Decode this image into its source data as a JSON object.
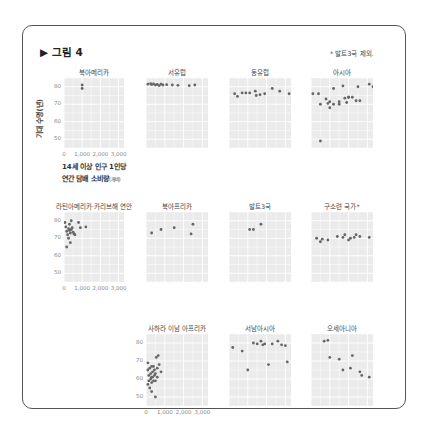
{
  "figure": {
    "title": "▶ 그림 4",
    "note": "* 발트3국 제외.",
    "y_axis_label": "기대 수명(년)",
    "x_axis_label_line1": "14세 이상 인구 1인당",
    "x_axis_label_line2": "연간 담배 소비량",
    "x_axis_label_unit": "(개비)",
    "colors": {
      "frame": "#555555",
      "panel_bg": "#ebebeb",
      "grid": "#ffffff",
      "point": "#666666"
    }
  },
  "chart_data": {
    "type": "scatter",
    "title": "그림 4",
    "xlabel": "14세 이상 인구 1인당 연간 담배 소비량(개비)",
    "ylabel": "기대 수명(년)",
    "xlim": [
      0,
      3300
    ],
    "ylim": [
      45,
      85
    ],
    "x_ticks": [
      "0",
      "1,000",
      "2,000",
      "3,000"
    ],
    "y_ticks": [
      "50",
      "60",
      "70",
      "80"
    ],
    "grid": true,
    "facet_layout": "3 rows, small multiples, shared axes",
    "note": "* 발트3국 제외.",
    "data_quality": "Traced approximations, not measured data. Point coordinates were read by eye from low-resolution zooms of ~60px panels (about 50 cigarettes per pixel on x, about 0.5 years per pixel on y). The figure has no data labels or country names; markers were not counted exactly. Treat values as rough shape only, not citable numbers.",
    "panels": [
      {
        "name": "북아메리카",
        "points": [
          [
            1000,
            81
          ],
          [
            1000,
            79
          ]
        ]
      },
      {
        "name": "서유럽",
        "points": [
          [
            100,
            81.5
          ],
          [
            250,
            81.8
          ],
          [
            300,
            81.2
          ],
          [
            400,
            81.6
          ],
          [
            500,
            81
          ],
          [
            600,
            81.3
          ],
          [
            700,
            80.7
          ],
          [
            800,
            81.5
          ],
          [
            900,
            81
          ],
          [
            1100,
            81.2
          ],
          [
            1400,
            81
          ],
          [
            1700,
            80.8
          ],
          [
            2300,
            80.6
          ],
          [
            2600,
            81
          ]
        ]
      },
      {
        "name": "동유럽",
        "points": [
          [
            300,
            76
          ],
          [
            450,
            74.5
          ],
          [
            700,
            76.5
          ],
          [
            900,
            76.5
          ],
          [
            1100,
            76.5
          ],
          [
            1400,
            77.5
          ],
          [
            1450,
            75
          ],
          [
            1650,
            75.5
          ],
          [
            1900,
            76
          ],
          [
            2300,
            79
          ],
          [
            2700,
            77.5
          ],
          [
            3200,
            76
          ]
        ]
      },
      {
        "name": "아시아",
        "points": [
          [
            100,
            76
          ],
          [
            400,
            76
          ],
          [
            500,
            70
          ],
          [
            800,
            73
          ],
          [
            900,
            70.5
          ],
          [
            1000,
            68
          ],
          [
            1000,
            71.5
          ],
          [
            1200,
            79
          ],
          [
            1200,
            70
          ],
          [
            1500,
            70
          ],
          [
            1500,
            71.5
          ],
          [
            1700,
            80.5
          ],
          [
            1800,
            73.5
          ],
          [
            1900,
            71
          ],
          [
            2000,
            74
          ],
          [
            2000,
            74
          ],
          [
            2200,
            74
          ],
          [
            2400,
            72
          ],
          [
            2600,
            72
          ],
          [
            3100,
            81.5
          ],
          [
            3300,
            80
          ],
          [
            3400,
            75
          ],
          [
            3400,
            72
          ],
          [
            500,
            49
          ],
          [
            2500,
            80
          ]
        ]
      },
      {
        "name": "라틴아메리카·카리브해 연안",
        "points": [
          [
            50,
            79
          ],
          [
            100,
            76.5
          ],
          [
            150,
            74
          ],
          [
            200,
            72
          ],
          [
            250,
            75.5
          ],
          [
            300,
            78
          ],
          [
            300,
            74.5
          ],
          [
            350,
            73
          ],
          [
            400,
            80
          ],
          [
            400,
            75
          ],
          [
            450,
            76
          ],
          [
            500,
            73.5
          ],
          [
            550,
            72.5
          ],
          [
            600,
            72
          ],
          [
            800,
            79
          ],
          [
            900,
            76
          ],
          [
            1200,
            76.5
          ],
          [
            150,
            65
          ],
          [
            350,
            67.5
          ],
          [
            250,
            70
          ]
        ]
      },
      {
        "name": "북아프리카",
        "points": [
          [
            300,
            73
          ],
          [
            800,
            75
          ],
          [
            1500,
            76
          ],
          [
            2400,
            72.5
          ],
          [
            2500,
            78
          ]
        ]
      },
      {
        "name": "발트3국",
        "points": [
          [
            1100,
            75
          ],
          [
            1300,
            75
          ],
          [
            1700,
            78
          ]
        ]
      },
      {
        "name": "구소련 국가*",
        "points": [
          [
            300,
            70
          ],
          [
            500,
            68
          ],
          [
            600,
            69.5
          ],
          [
            900,
            69
          ],
          [
            1400,
            71
          ],
          [
            1700,
            70.5
          ],
          [
            1800,
            72
          ],
          [
            2000,
            69
          ],
          [
            2100,
            70
          ],
          [
            2300,
            70.5
          ],
          [
            2400,
            72
          ],
          [
            2600,
            71
          ],
          [
            3100,
            70.5
          ]
        ]
      },
      {
        "name": "사하라 이남 아프리카",
        "points": [
          [
            100,
            69
          ],
          [
            100,
            65
          ],
          [
            100,
            57
          ],
          [
            150,
            62
          ],
          [
            150,
            59
          ],
          [
            200,
            66
          ],
          [
            200,
            55
          ],
          [
            250,
            63
          ],
          [
            250,
            60
          ],
          [
            300,
            67
          ],
          [
            300,
            61
          ],
          [
            300,
            58
          ],
          [
            300,
            53
          ],
          [
            350,
            64
          ],
          [
            350,
            61
          ],
          [
            400,
            67
          ],
          [
            400,
            59
          ],
          [
            450,
            65
          ],
          [
            450,
            62
          ],
          [
            500,
            63
          ],
          [
            500,
            59
          ],
          [
            500,
            50
          ],
          [
            550,
            72
          ],
          [
            600,
            66
          ],
          [
            600,
            61
          ],
          [
            650,
            73
          ],
          [
            700,
            68
          ],
          [
            800,
            64
          ]
        ]
      },
      {
        "name": "서남아시아",
        "points": [
          [
            200,
            77.5
          ],
          [
            700,
            75.5
          ],
          [
            1000,
            65
          ],
          [
            1300,
            80
          ],
          [
            1500,
            79.5
          ],
          [
            1700,
            81
          ],
          [
            1800,
            79
          ],
          [
            1900,
            79.5
          ],
          [
            2100,
            68
          ],
          [
            2300,
            79.5
          ],
          [
            2600,
            81
          ],
          [
            2800,
            79
          ],
          [
            3000,
            78.5
          ],
          [
            3100,
            69.5
          ]
        ]
      },
      {
        "name": "오세아니아",
        "points": [
          [
            700,
            81
          ],
          [
            900,
            81.5
          ],
          [
            1000,
            72
          ],
          [
            1500,
            71
          ],
          [
            1700,
            65
          ],
          [
            2200,
            73
          ],
          [
            2100,
            66
          ],
          [
            2600,
            64
          ],
          [
            2700,
            62
          ],
          [
            3100,
            61
          ]
        ]
      }
    ]
  }
}
